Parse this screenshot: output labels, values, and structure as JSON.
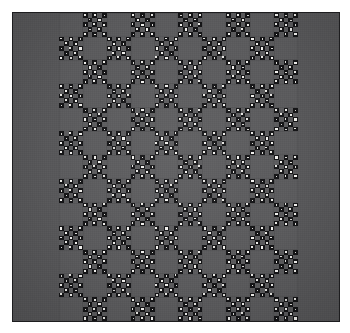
{
  "artwork": {
    "title": "Patchwork quilt",
    "kind": "photograph-of-textile",
    "description": "Dark gray patchwork quilt with plain side borders and a central pieced panel of alternating plain squares and X / nine-patch star blocks in black-and-white polka-dot calico.",
    "orientation": "portrait-square"
  },
  "canvas": {
    "width": 350,
    "height": 333,
    "background_color": "#ffffff",
    "margin": 12
  },
  "quilt": {
    "left": 12,
    "top": 12,
    "width": 328,
    "height": 310,
    "binding_color": "#1d1d1f",
    "border_fabric_color": "#58585a",
    "side_border_width": 46
  },
  "panel": {
    "left": 46,
    "top": 0,
    "width": 239,
    "height": 308,
    "columns": 10,
    "rows": 13,
    "block_size": 23.9,
    "background_color": "#4f4f51"
  },
  "palette": {
    "plain_square": "#5b5b5d",
    "plain_square_edge": "#545456",
    "print_ground": "#141416",
    "print_dot": "#f2f1ee",
    "border": "#58585a",
    "binding": "#1d1d1f",
    "page": "#ffffff"
  },
  "block_types": {
    "plain": "plain-square",
    "star": "x-cross-star-block"
  },
  "star_block_layout": [
    [
      "dark-dot",
      "gray",
      "dark-dot",
      "gray",
      "dark-dot"
    ],
    [
      "gray",
      "dark-dot",
      "gray",
      "dark-dot",
      "gray"
    ],
    [
      "dark-dot",
      "gray",
      "dark-dot",
      "gray",
      "dark-dot"
    ],
    [
      "gray",
      "dark-dot",
      "gray",
      "dark-dot",
      "gray"
    ],
    [
      "dark-dot",
      "gray",
      "dark-dot",
      "gray",
      "dark-dot"
    ]
  ],
  "grid": [
    [
      "plain",
      "star",
      "plain",
      "star",
      "plain",
      "star",
      "plain",
      "star",
      "plain",
      "star"
    ],
    [
      "star",
      "plain",
      "star",
      "plain",
      "star",
      "plain",
      "star",
      "plain",
      "star",
      "plain"
    ],
    [
      "plain",
      "star",
      "plain",
      "star",
      "plain",
      "star",
      "plain",
      "star",
      "plain",
      "star"
    ],
    [
      "star",
      "plain",
      "star",
      "plain",
      "star",
      "plain",
      "star",
      "plain",
      "star",
      "plain"
    ],
    [
      "plain",
      "star",
      "plain",
      "star",
      "plain",
      "star",
      "plain",
      "star",
      "plain",
      "star"
    ],
    [
      "star",
      "plain",
      "star",
      "plain",
      "star",
      "plain",
      "star",
      "plain",
      "star",
      "plain"
    ],
    [
      "plain",
      "star",
      "plain",
      "star",
      "plain",
      "star",
      "plain",
      "star",
      "plain",
      "star"
    ],
    [
      "star",
      "plain",
      "star",
      "plain",
      "star",
      "plain",
      "star",
      "plain",
      "star",
      "plain"
    ],
    [
      "plain",
      "star",
      "plain",
      "star",
      "plain",
      "star",
      "plain",
      "star",
      "plain",
      "star"
    ],
    [
      "star",
      "plain",
      "star",
      "plain",
      "star",
      "plain",
      "star",
      "plain",
      "star",
      "plain"
    ],
    [
      "plain",
      "star",
      "plain",
      "star",
      "plain",
      "star",
      "plain",
      "star",
      "plain",
      "star"
    ],
    [
      "star",
      "plain",
      "star",
      "plain",
      "star",
      "plain",
      "star",
      "plain",
      "star",
      "plain"
    ],
    [
      "plain",
      "star",
      "plain",
      "star",
      "plain",
      "star",
      "plain",
      "star",
      "plain",
      "star"
    ]
  ]
}
